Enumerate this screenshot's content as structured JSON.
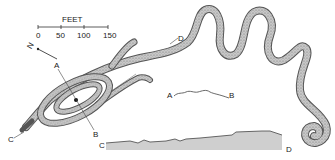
{
  "diagram": {
    "scale": {
      "unit_label": "FEET",
      "ticks": [
        "0",
        "50",
        "100",
        "150"
      ]
    },
    "north_arrow": {
      "label": "N"
    },
    "section_labels": {
      "a": "A",
      "b": "B",
      "c": "C",
      "d": "D"
    },
    "profiles": [
      {
        "name": "A-B profile",
        "start": "A",
        "end": "B"
      },
      {
        "name": "C-D profile",
        "start": "C",
        "end": "D"
      }
    ],
    "colors": {
      "mound_fill": "#bdbdbd",
      "mound_outline": "#4a4a4a",
      "profile_fill": "#cfcfcf",
      "ink": "#222222"
    }
  }
}
